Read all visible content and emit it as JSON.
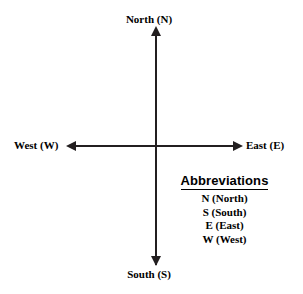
{
  "figure": {
    "background_color": "#ffffff",
    "line_color": "#231f20"
  },
  "axes": {
    "vertical": {
      "name": "north-south-axis",
      "top_label": "North (N)",
      "bottom_label": "South (S)",
      "arrowheads": "both"
    },
    "horizontal": {
      "name": "west-east-axis",
      "left_label": "West (W)",
      "right_label": "East (E)",
      "arrowheads": "both"
    }
  },
  "labels": {
    "north": "North (N)",
    "south": "South (S)",
    "west": "West (W)",
    "east": "East (E)"
  },
  "abbreviations": {
    "heading": "Abbreviations",
    "items": [
      "N (North)",
      "S (South)",
      "E (East)",
      "W (West)"
    ]
  }
}
